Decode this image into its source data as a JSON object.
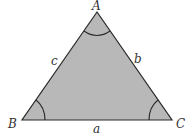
{
  "diagram": {
    "type": "triangle",
    "fill_color": "#b8b8b8",
    "stroke_color": "#2a2a2a",
    "vertices": [
      {
        "label": "A",
        "x": 97,
        "y": 12
      },
      {
        "label": "B",
        "x": 22,
        "y": 120
      },
      {
        "label": "C",
        "x": 172,
        "y": 120
      }
    ],
    "sides": [
      {
        "label": "a",
        "between": "B-C"
      },
      {
        "label": "b",
        "between": "A-C"
      },
      {
        "label": "c",
        "between": "A-B"
      }
    ],
    "angle_arcs": [
      "A",
      "B",
      "C"
    ]
  }
}
